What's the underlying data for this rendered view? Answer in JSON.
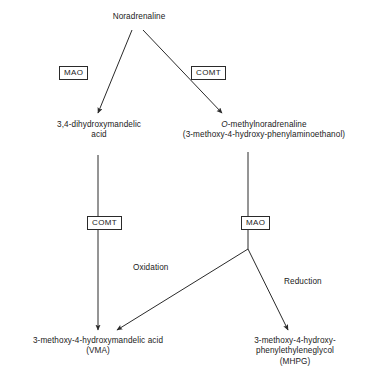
{
  "diagram": {
    "title": "Noradrenaline metabolism pathway",
    "type": "flow-diagram",
    "stroke_color": "#2a2a2a",
    "background_color": "#ffffff",
    "nodes": {
      "noradrenaline": {
        "line1": "Noradrenaline"
      },
      "dihydroxymandelic_acid": {
        "line1": "3,4-dihydroxymandelic",
        "line2": "acid"
      },
      "o_methylnoradrenaline": {
        "italic_prefix": "O",
        "line1_rest": "-methylnoradrenaline",
        "line2": "(3-methoxy-4-hydroxy-phenylaminoethanol)"
      },
      "vma": {
        "line1": "3-methoxy-4-hydroxymandelic acid",
        "line2": "(VMA)"
      },
      "mhpg": {
        "line1": "3-methoxy-4-hydroxy-",
        "line2": "phenylethyleneglycol",
        "line3": "(MHPG)"
      }
    },
    "enzymes": {
      "mao_top": "MAO",
      "comt_top": "COMT",
      "comt_bottom": "COMT",
      "mao_bottom": "MAO"
    },
    "reactions": {
      "oxidation": "Oxidation",
      "reduction": "Reduction"
    }
  }
}
